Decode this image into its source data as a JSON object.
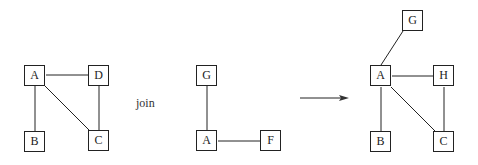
{
  "graphs": {
    "left": {
      "nodes": [
        "A",
        "D",
        "B",
        "C"
      ],
      "edges": [
        [
          "A",
          "D"
        ],
        [
          "A",
          "B"
        ],
        [
          "A",
          "C"
        ],
        [
          "D",
          "C"
        ]
      ]
    },
    "middle": {
      "nodes": [
        "G",
        "A",
        "F"
      ],
      "edges": [
        [
          "G",
          "A"
        ],
        [
          "A",
          "F"
        ]
      ]
    },
    "right": {
      "nodes": [
        "G",
        "A",
        "H",
        "B",
        "C"
      ],
      "edges": [
        [
          "G",
          "A"
        ],
        [
          "A",
          "H"
        ],
        [
          "A",
          "B"
        ],
        [
          "A",
          "C"
        ],
        [
          "H",
          "C"
        ]
      ]
    }
  },
  "operation_label": "join",
  "arrow": "result-arrow"
}
